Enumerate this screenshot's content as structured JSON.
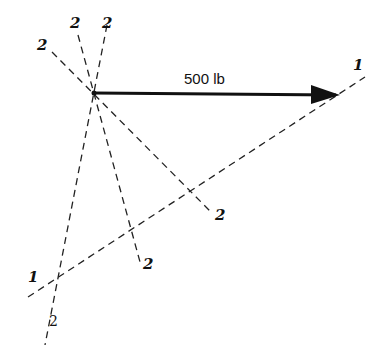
{
  "figure": {
    "force_label": "500 lb",
    "line_labels": {
      "line1_right": "1",
      "line1_left": "1",
      "line2a_top": "2",
      "line2a_bottom": "2",
      "line2b_top": "2",
      "line2b_bottom": "2",
      "line2c_top": "2",
      "line2c_bottom": "2"
    },
    "colors": {
      "ink": "#111111",
      "background": "#ffffff"
    }
  }
}
